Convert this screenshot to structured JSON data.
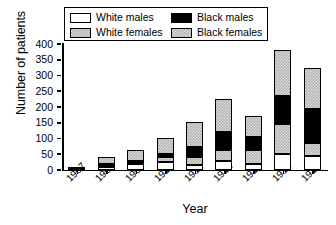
{
  "chart_data": {
    "type": "bar",
    "stacked": true,
    "title": "",
    "xlabel": "Year",
    "ylabel": "Number of patients",
    "categories": [
      "1907",
      "1908",
      "1909",
      "1910",
      "1911",
      "1912",
      "1913",
      "1914",
      "1915"
    ],
    "ylim": [
      0,
      400
    ],
    "yticks": [
      0,
      50,
      100,
      150,
      200,
      250,
      300,
      350,
      400
    ],
    "grid": false,
    "legend_position": "top",
    "series": [
      {
        "name": "White males",
        "color": "#ffffff",
        "values": [
          4,
          9,
          18,
          24,
          15,
          30,
          18,
          52,
          45
        ]
      },
      {
        "name": "White females",
        "color": "#b4b4b4",
        "values": [
          1,
          5,
          5,
          18,
          26,
          33,
          47,
          94,
          40
        ]
      },
      {
        "name": "Black males",
        "color": "#000000",
        "values": [
          0,
          6,
          5,
          10,
          31,
          59,
          41,
          89,
          110
        ]
      },
      {
        "name": "Black females",
        "color": "#b4b4b4",
        "values": [
          0,
          22,
          34,
          50,
          82,
          104,
          64,
          145,
          130
        ]
      }
    ],
    "totals": [
      5,
      42,
      62,
      102,
      154,
      226,
      170,
      380,
      325
    ]
  },
  "legend": {
    "entries": [
      {
        "label": "White males",
        "swatch": "white-males"
      },
      {
        "label": "White females",
        "swatch": "white-females"
      },
      {
        "label": "Black males",
        "swatch": "black-males"
      },
      {
        "label": "Black females",
        "swatch": "black-females"
      }
    ]
  }
}
